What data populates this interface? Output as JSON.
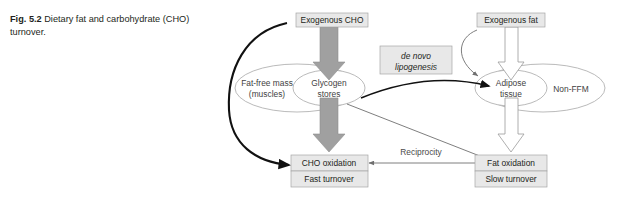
{
  "caption": {
    "label": "Fig. 5.2",
    "text": "Dietary fat and carbohydrate (CHO) turnover."
  },
  "diagram": {
    "title": "Dietary fat and carbohydrate (CHO) turnover",
    "boxes": {
      "exogenous_cho": "Exogenous CHO",
      "exogenous_fat": "Exogenous fat",
      "de_novo_line1": "de novo",
      "de_novo_line2": "lipogenesis",
      "cho_oxidation": "CHO oxidation",
      "fast_turnover": "Fast turnover",
      "fat_oxidation": "Fat oxidation",
      "slow_turnover": "Slow turnover"
    },
    "ellipses": {
      "glycogen_line1": "Glycogen",
      "glycogen_line2": "stores",
      "fat_free_mass_line1": "Fat-free mass",
      "fat_free_mass_line2": "(muscles)",
      "adipose_line1": "Adipose",
      "adipose_line2": "tissue",
      "non_ffm": "Non-FFM"
    },
    "labels": {
      "reciprocity": "Reciprocity"
    },
    "colors": {
      "box_fill": "#e8e8e8",
      "box_stroke": "#a6a6a6",
      "block_arrow_gray": "#a0a0a0",
      "block_arrow_white": "#ffffff",
      "block_arrow_stroke": "#9a9a9a",
      "ellipse_stroke": "#a8a8a8",
      "thick_arrow": "#1a1a1a",
      "thin_arrow": "#6f6f6f",
      "text": "#231f20",
      "background": "#ffffff"
    }
  }
}
